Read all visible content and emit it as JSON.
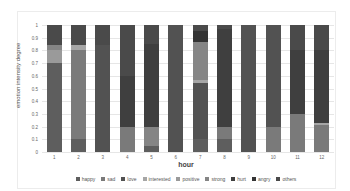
{
  "chart_data": {
    "type": "bar",
    "stacked": true,
    "title": "",
    "xlabel": "hour",
    "ylabel": "emotion intensity degree",
    "ylim": [
      0,
      1
    ],
    "yticks": [
      "0",
      "0.1",
      "0.2",
      "0.3",
      "0.4",
      "0.5",
      "0.6",
      "0.7",
      "0.8",
      "0.9",
      "1"
    ],
    "categories": [
      "1",
      "2",
      "3",
      "4",
      "5",
      "6",
      "7",
      "8",
      "9",
      "10",
      "11",
      "12"
    ],
    "legend_position": "bottom",
    "grid": true,
    "series": [
      {
        "name": "happy",
        "color": "#5e5e5e",
        "values": [
          0.7,
          0.1,
          0.0,
          0.0,
          0.05,
          0.0,
          0.1,
          0.1,
          0.0,
          0.0,
          0.0,
          0.0
        ]
      },
      {
        "name": "sad",
        "color": "#7a7a7a",
        "values": [
          0.0,
          0.7,
          0.0,
          0.2,
          0.0,
          0.0,
          0.0,
          0.1,
          0.0,
          0.2,
          0.3,
          0.21
        ]
      },
      {
        "name": "love",
        "color": "#525252",
        "values": [
          0.0,
          0.0,
          0.84,
          0.0,
          0.0,
          1.0,
          0.44,
          0.0,
          1.0,
          0.8,
          0.0,
          0.0
        ]
      },
      {
        "name": "interested",
        "color": "#a6a6a6",
        "values": [
          0.0,
          0.04,
          0.0,
          0.0,
          0.0,
          0.0,
          0.03,
          0.0,
          0.0,
          0.0,
          0.0,
          0.02
        ]
      },
      {
        "name": "positive",
        "color": "#9a9a9a",
        "values": [
          0.1,
          0.0,
          0.0,
          0.0,
          0.0,
          0.0,
          0.0,
          0.0,
          0.0,
          0.0,
          0.0,
          0.0
        ]
      },
      {
        "name": "strong",
        "color": "#858585",
        "values": [
          0.04,
          0.0,
          0.0,
          0.0,
          0.15,
          0.0,
          0.3,
          0.0,
          0.0,
          0.0,
          0.0,
          0.0
        ]
      },
      {
        "name": "hurt",
        "color": "#3f3f3f",
        "values": [
          0.0,
          0.0,
          0.0,
          0.4,
          0.65,
          0.0,
          0.0,
          0.77,
          0.0,
          0.0,
          0.5,
          0.57
        ]
      },
      {
        "name": "angry",
        "color": "#343434",
        "values": [
          0.0,
          0.0,
          0.0,
          0.0,
          0.0,
          0.0,
          0.08,
          0.0,
          0.0,
          0.0,
          0.0,
          0.0
        ]
      },
      {
        "name": "others",
        "color": "#4a4a4a",
        "values": [
          0.16,
          0.16,
          0.16,
          0.4,
          0.15,
          0.0,
          0.05,
          0.03,
          0.0,
          0.0,
          0.2,
          0.2
        ]
      }
    ]
  }
}
